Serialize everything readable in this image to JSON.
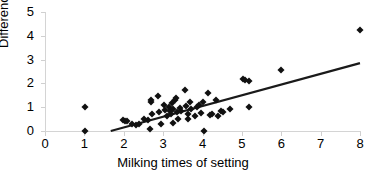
{
  "chart_data": {
    "type": "scatter",
    "title": "",
    "xlabel": "Milking times of setting",
    "ylabel": "Difference",
    "xlim": [
      0,
      8
    ],
    "ylim": [
      0,
      5
    ],
    "xticks": [
      0,
      1,
      2,
      3,
      4,
      5,
      6,
      7,
      8
    ],
    "yticks": [
      0,
      1,
      2,
      3,
      4,
      5
    ],
    "grid": false,
    "legend": null,
    "marker": "diamond",
    "marker_color": "#111111",
    "axis_color": "#d4d4d4",
    "series": [
      {
        "name": "Difference vs milking times",
        "points": [
          [
            1.02,
            1.0
          ],
          [
            1.02,
            0.02
          ],
          [
            1.98,
            0.48
          ],
          [
            2.02,
            0.4
          ],
          [
            2.08,
            0.42
          ],
          [
            2.2,
            0.3
          ],
          [
            2.3,
            0.26
          ],
          [
            2.38,
            0.3
          ],
          [
            2.52,
            0.52
          ],
          [
            2.62,
            0.46
          ],
          [
            2.66,
            0.1
          ],
          [
            2.68,
            1.22
          ],
          [
            2.7,
            1.32
          ],
          [
            2.72,
            0.72
          ],
          [
            2.86,
            1.46
          ],
          [
            2.9,
            0.78
          ],
          [
            2.94,
            0.3
          ],
          [
            3.02,
            1.08
          ],
          [
            3.06,
            0.9
          ],
          [
            3.1,
            0.64
          ],
          [
            3.14,
            1.0
          ],
          [
            3.18,
            0.86
          ],
          [
            3.2,
            0.72
          ],
          [
            3.22,
            1.18
          ],
          [
            3.24,
            0.92
          ],
          [
            3.26,
            0.34
          ],
          [
            3.3,
            1.3
          ],
          [
            3.32,
            1.38
          ],
          [
            3.34,
            0.8
          ],
          [
            3.38,
            0.52
          ],
          [
            3.42,
            0.96
          ],
          [
            3.46,
            0.86
          ],
          [
            3.56,
            1.74
          ],
          [
            3.58,
            1.04
          ],
          [
            3.62,
            0.5
          ],
          [
            3.64,
            0.72
          ],
          [
            3.68,
            1.22
          ],
          [
            3.72,
            0.94
          ],
          [
            3.8,
            0.62
          ],
          [
            3.86,
            1.0
          ],
          [
            3.92,
            1.08
          ],
          [
            3.96,
            0.76
          ],
          [
            4.02,
            1.2
          ],
          [
            4.04,
            0.02
          ],
          [
            4.14,
            1.6
          ],
          [
            4.18,
            0.68
          ],
          [
            4.24,
            0.7
          ],
          [
            4.34,
            1.3
          ],
          [
            4.4,
            0.62
          ],
          [
            4.46,
            0.82
          ],
          [
            4.52,
            0.78
          ],
          [
            4.7,
            0.92
          ],
          [
            5.02,
            2.2
          ],
          [
            5.08,
            2.16
          ],
          [
            5.18,
            2.12
          ],
          [
            5.18,
            1.0
          ],
          [
            6.0,
            2.55
          ],
          [
            8.0,
            4.25
          ]
        ]
      }
    ],
    "trendline": {
      "type": "linear",
      "color": "#1a1a1a",
      "x_start": 1.67,
      "y_start": 0.0,
      "x_end": 8.0,
      "y_end": 2.85
    }
  }
}
